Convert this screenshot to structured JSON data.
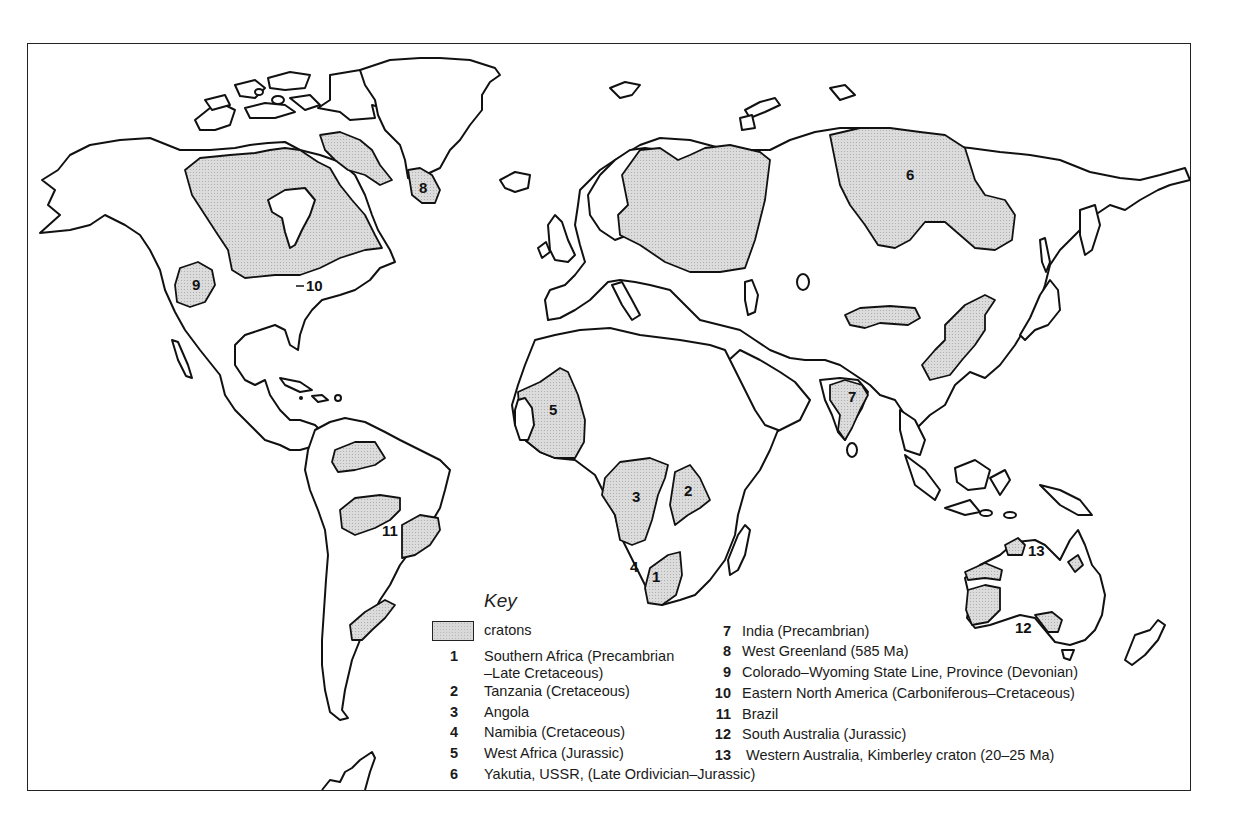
{
  "figure": {
    "type": "world-map",
    "fill_color": "#d9d9d9",
    "outline_color": "#111111"
  },
  "map_labels": [
    {
      "id": "1",
      "text": "1",
      "region": "Southern Africa"
    },
    {
      "id": "2",
      "text": "2",
      "region": "Tanzania"
    },
    {
      "id": "3",
      "text": "3",
      "region": "Angola"
    },
    {
      "id": "4",
      "text": "4",
      "region": "Namibia"
    },
    {
      "id": "5",
      "text": "5",
      "region": "West Africa"
    },
    {
      "id": "6",
      "text": "6",
      "region": "Yakutia"
    },
    {
      "id": "7",
      "text": "7",
      "region": "India"
    },
    {
      "id": "8",
      "text": "8",
      "region": "West Greenland"
    },
    {
      "id": "9",
      "text": "9",
      "region": "Colorado-Wyoming"
    },
    {
      "id": "10",
      "text": "10",
      "region": "Eastern North America"
    },
    {
      "id": "11",
      "text": "11",
      "region": "Brazil"
    },
    {
      "id": "12",
      "text": "12",
      "region": "South Australia"
    },
    {
      "id": "13",
      "text": "13",
      "region": "Western Australia"
    }
  ],
  "key": {
    "title": "Key",
    "swatch_label": "cratons",
    "items": [
      {
        "num": "1",
        "text": "Southern Africa (Precambrian",
        "text2": "–Late Cretaceous)"
      },
      {
        "num": "2",
        "text": "Tanzania (Cretaceous)"
      },
      {
        "num": "3",
        "text": "Angola"
      },
      {
        "num": "4",
        "text": "Namibia (Cretaceous)"
      },
      {
        "num": "5",
        "text": "West Africa (Jurassic)"
      },
      {
        "num": "6",
        "text": "Yakutia, USSR, (Late Ordivician–Jurassic)"
      },
      {
        "num": "7",
        "text": "India (Precambrian)"
      },
      {
        "num": "8",
        "text": "West Greenland (585 Ma)"
      },
      {
        "num": "9",
        "text": "Colorado–Wyoming State Line, Province (Devonian)"
      },
      {
        "num": "10",
        "text": "Eastern North America (Carboniferous–Cretaceous)"
      },
      {
        "num": "11",
        "text": "Brazil"
      },
      {
        "num": "12",
        "text": "South Australia (Jurassic)"
      },
      {
        "num": "13",
        "text": "Western Australia, Kimberley craton (20–25 Ma)"
      }
    ]
  }
}
